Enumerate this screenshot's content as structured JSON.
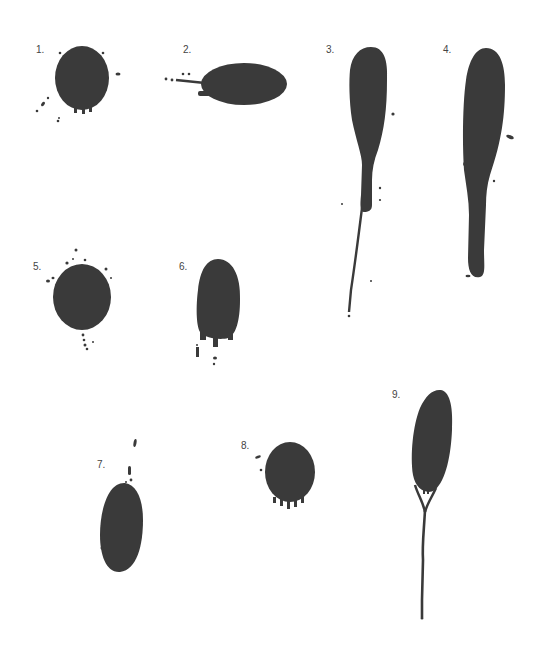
{
  "figure": {
    "ink_color": "#3a3a3a",
    "label_color": "#444444",
    "drops": [
      {
        "id": "drop-1",
        "label": "1."
      },
      {
        "id": "drop-2",
        "label": "2."
      },
      {
        "id": "drop-3",
        "label": "3."
      },
      {
        "id": "drop-4",
        "label": "4."
      },
      {
        "id": "drop-5",
        "label": "5."
      },
      {
        "id": "drop-6",
        "label": "6."
      },
      {
        "id": "drop-7",
        "label": "7."
      },
      {
        "id": "drop-8",
        "label": "8."
      },
      {
        "id": "drop-9",
        "label": "9."
      }
    ]
  }
}
